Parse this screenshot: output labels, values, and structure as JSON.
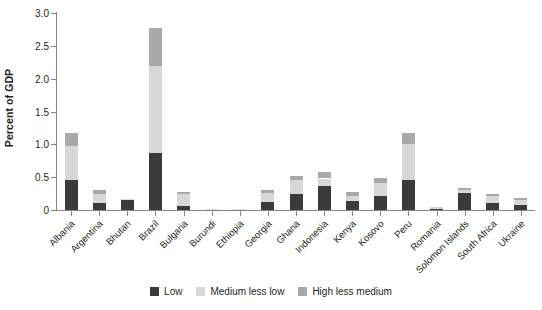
{
  "chart_data": {
    "type": "bar",
    "subtype": "stacked-vertical",
    "title": "",
    "subtitle": "",
    "xlabel": "",
    "ylabel": "Percent of GDP",
    "ylim": [
      0,
      3.0
    ],
    "ytick_labels": [
      "0",
      "0.5",
      "1.0",
      "1.5",
      "2.0",
      "2.5",
      "3.0"
    ],
    "ytick_values": [
      0,
      0.5,
      1.0,
      1.5,
      2.0,
      2.5,
      3.0
    ],
    "grid": false,
    "legend_position": "bottom-center",
    "categories": [
      "Albania",
      "Argentina",
      "Bhutan",
      "Brazil",
      "Bulgaria",
      "Burundi",
      "Ethiopia",
      "Georgia",
      "Ghana",
      "Indonesia",
      "Kenya",
      "Kosovo",
      "Peru",
      "Romania",
      "Solomon Islands",
      "South Africa",
      "Ukraine"
    ],
    "series": [
      {
        "name": "Low",
        "color": "#3b3b3b",
        "values": [
          0.45,
          0.11,
          0.16,
          0.87,
          0.06,
          0.01,
          0.005,
          0.12,
          0.25,
          0.36,
          0.13,
          0.22,
          0.45,
          0.01,
          0.26,
          0.11,
          0.07
        ]
      },
      {
        "name": "Medium less low",
        "color": "#d8d8d8",
        "values": [
          0.52,
          0.14,
          0.01,
          1.33,
          0.18,
          0.01,
          0.005,
          0.14,
          0.2,
          0.12,
          0.09,
          0.19,
          0.55,
          0.03,
          0.04,
          0.11,
          0.09
        ]
      },
      {
        "name": "High less medium",
        "color": "#a9a9a9",
        "values": [
          0.21,
          0.05,
          0.0,
          0.57,
          0.04,
          0.0,
          0.0,
          0.04,
          0.07,
          0.1,
          0.05,
          0.08,
          0.18,
          0.0,
          0.03,
          0.03,
          0.03
        ]
      }
    ],
    "totals": [
      1.18,
      0.3,
      0.17,
      2.77,
      0.28,
      0.02,
      0.01,
      0.3,
      0.52,
      0.58,
      0.27,
      0.49,
      1.18,
      0.04,
      0.33,
      0.25,
      0.19
    ]
  },
  "legend": {
    "items": [
      {
        "label": "Low",
        "color": "#3b3b3b"
      },
      {
        "label": "Medium less low",
        "color": "#d8d8d8"
      },
      {
        "label": "High less medium",
        "color": "#a9a9a9"
      }
    ]
  },
  "axes": {
    "y_title": "Percent of GDP"
  },
  "colors": {
    "axis": "#888684",
    "text": "#231f20",
    "background": "#ffffff"
  }
}
